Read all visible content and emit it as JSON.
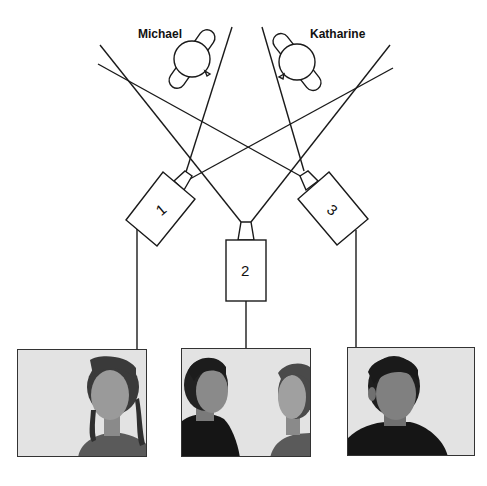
{
  "people": [
    {
      "name": "Michael"
    },
    {
      "name": "Katharine"
    }
  ],
  "cameras": [
    {
      "label": "1"
    },
    {
      "label": "2"
    },
    {
      "label": "3"
    }
  ],
  "photos": [
    {
      "camera": "1",
      "subjects": [
        "Katharine"
      ],
      "description": "girl with braids, facing slightly left"
    },
    {
      "camera": "2",
      "subjects": [
        "Michael",
        "Katharine"
      ],
      "description": "two-shot profile: Michael facing right, Katharine facing left"
    },
    {
      "camera": "3",
      "subjects": [
        "Michael"
      ],
      "description": "young man facing slightly right"
    }
  ],
  "colors": {
    "line": "#1a1a1a",
    "photo_bg": "#e3e3e3",
    "hair": "#2a2a2a",
    "skin": "#8c8c8c",
    "shirt": "#151515"
  }
}
